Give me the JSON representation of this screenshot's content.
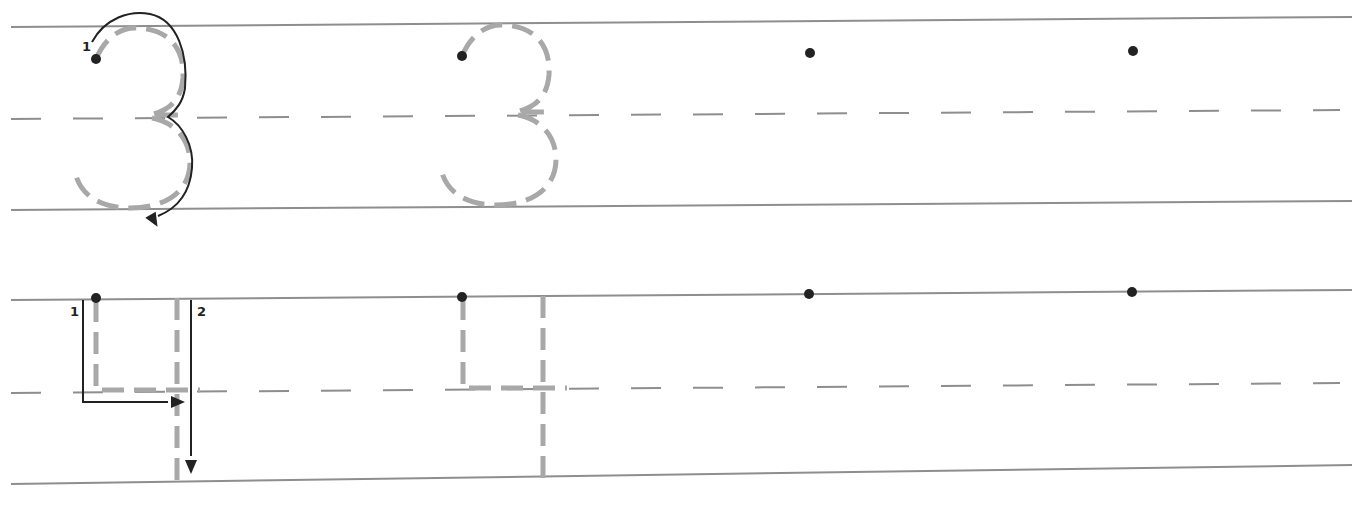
{
  "worksheet": {
    "colors": {
      "background": "#ffffff",
      "ruled_line": "#8e8e8e",
      "trace_gray": "#a8a8a8",
      "ink": "#222222"
    },
    "rows": [
      {
        "name": "row-digit-3",
        "digit": "3",
        "top_line": {
          "x1": 11,
          "y1": 27,
          "x2": 1352,
          "y2": 17
        },
        "mid_line": {
          "x1": 11,
          "y1": 119,
          "x2": 1340,
          "y2": 110
        },
        "bottom_line": {
          "x1": 11,
          "y1": 210,
          "x2": 1352,
          "y2": 201
        },
        "model": {
          "dot": {
            "x": 96,
            "y": 59
          },
          "stroke_labels": [
            {
              "text": "1",
              "x": 82,
              "y": 51
            }
          ],
          "trace_paths": [
            "M96,59 C104,40 118,28 135,28 C165,28 185,45 183,78 C181,100 170,110 150,115 L185,115",
            "M152,118 C175,122 190,140 190,162 C190,192 165,208 130,208 C100,208 80,195 75,172"
          ],
          "arrow_paths": [
            "M92,42 C105,18 130,10 150,14 C178,20 188,55 185,88 C183,102 176,110 168,117 C182,125 194,145 192,168 C190,192 178,208 158,216"
          ],
          "arrow_heads": [
            {
              "x": 153,
              "y": 219,
              "angle": 150
            }
          ]
        },
        "guide": {
          "dot": {
            "x": 462,
            "y": 56
          },
          "trace_paths": [
            "M462,56 C470,37 484,25 501,25 C531,25 551,42 549,75 C547,97 536,107 516,112 L551,112",
            "M518,115 C541,119 556,137 556,159 C556,189 531,205 496,205 C466,205 446,192 441,169"
          ]
        },
        "practice_dots": [
          {
            "x": 810,
            "y": 53
          },
          {
            "x": 1133,
            "y": 51
          }
        ]
      },
      {
        "name": "row-digit-4",
        "digit": "4",
        "top_line": {
          "x1": 11,
          "y1": 300,
          "x2": 1352,
          "y2": 290
        },
        "mid_line": {
          "x1": 11,
          "y1": 393,
          "x2": 1340,
          "y2": 383
        },
        "bottom_line": {
          "x1": 11,
          "y1": 484,
          "x2": 1352,
          "y2": 465
        },
        "model": {
          "dot": {
            "x": 96,
            "y": 298
          },
          "stroke_labels": [
            {
              "text": "1",
              "x": 70,
              "y": 316
            },
            {
              "text": "2",
              "x": 197,
              "y": 316
            }
          ],
          "trace_paths": [
            "M96,300 L96,390 L200,390",
            "M177,298 L177,482"
          ],
          "arrow_paths": [
            "M83,300 L83,402 L168,402",
            "M191,300 L191,456"
          ],
          "arrow_heads": [
            {
              "x": 176,
              "y": 402,
              "angle": 90
            },
            {
              "x": 191,
              "y": 465,
              "angle": 180
            }
          ]
        },
        "guide": {
          "dot": {
            "x": 462,
            "y": 297
          },
          "trace_paths": [
            "M463,298 L463,388 L567,388",
            "M543,296 L543,480"
          ]
        },
        "practice_dots": [
          {
            "x": 809,
            "y": 294
          },
          {
            "x": 1132,
            "y": 292
          }
        ]
      }
    ]
  }
}
